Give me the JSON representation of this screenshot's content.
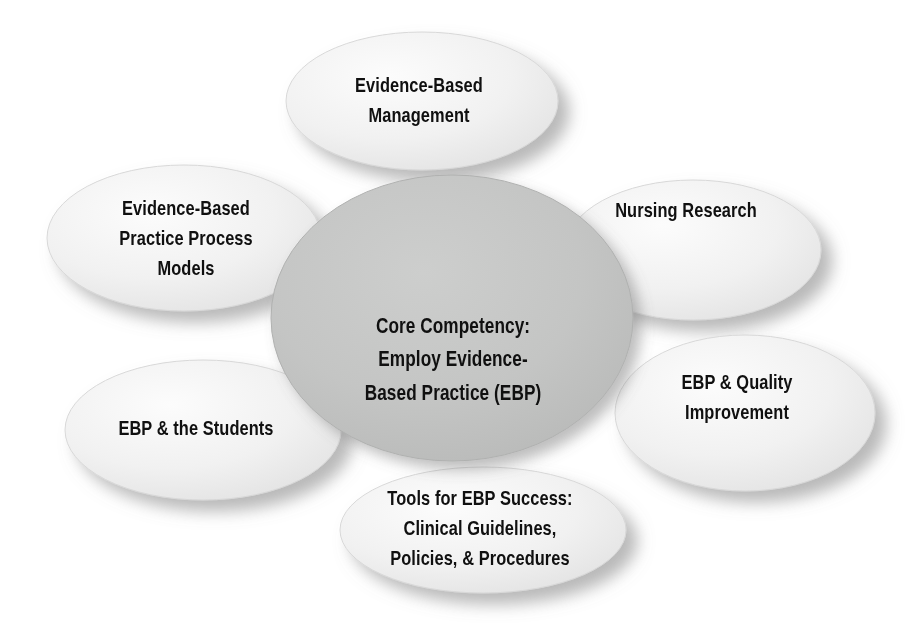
{
  "diagram": {
    "type": "hub-and-spoke",
    "background_color": "#ffffff",
    "center": {
      "id": "core-competency",
      "text": "Core Competency:\nEmploy Evidence-\nBased Practice (EBP)",
      "fill_color": "#c3c4c4",
      "text_color": "#101010",
      "cx": 452,
      "cy": 318,
      "rx": 181,
      "ry": 143
    },
    "satellites": [
      {
        "id": "evidence-based-management",
        "text": "Evidence-Based\nManagement",
        "fill_color": "#f2f2f2",
        "text_color": "#101010",
        "cx": 422,
        "cy": 101,
        "rx": 136,
        "ry": 69,
        "label_cx": 419,
        "label_cy": 100
      },
      {
        "id": "evidence-based-practice-process-models",
        "text": "Evidence-Based\nPractice Process\nModels",
        "fill_color": "#f0f0f0",
        "text_color": "#101010",
        "cx": 184,
        "cy": 238,
        "rx": 137,
        "ry": 73,
        "label_cx": 186,
        "label_cy": 238
      },
      {
        "id": "nursing-research",
        "text": "Nursing Research",
        "fill_color": "#f0f0f0",
        "text_color": "#101010",
        "cx": 693,
        "cy": 250,
        "rx": 128,
        "ry": 70,
        "label_cx": 686,
        "label_cy": 210
      },
      {
        "id": "ebp-and-the-students",
        "text": "EBP & the Students",
        "fill_color": "#f0f0f0",
        "text_color": "#101010",
        "cx": 203,
        "cy": 430,
        "rx": 138,
        "ry": 70,
        "label_cx": 196,
        "label_cy": 428
      },
      {
        "id": "ebp-and-quality-improvement",
        "text": "EBP & Quality\nImprovement",
        "fill_color": "#f0f0f0",
        "text_color": "#101010",
        "cx": 745,
        "cy": 413,
        "rx": 130,
        "ry": 78,
        "label_cx": 737,
        "label_cy": 397
      },
      {
        "id": "tools-for-ebp-success",
        "text": "Tools for EBP Success:\nClinical Guidelines,\nPolicies, & Procedures",
        "fill_color": "#f0f0f0",
        "text_color": "#101010",
        "cx": 483,
        "cy": 530,
        "rx": 143,
        "ry": 63,
        "label_cx": 480,
        "label_cy": 528
      }
    ]
  }
}
